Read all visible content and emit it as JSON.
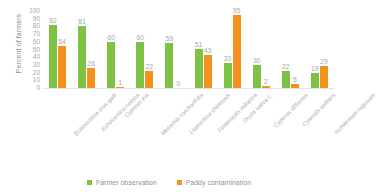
{
  "chart_data": {
    "type": "bar",
    "title": "",
    "subtitle": "",
    "xlabel": "",
    "ylabel": "Percent of farmers",
    "ylim": [
      0,
      100
    ],
    "ytick_step": 10,
    "yticks": [
      100,
      90,
      80,
      70,
      60,
      50,
      40,
      30,
      20,
      10,
      0
    ],
    "grid": false,
    "legend_position": "bottom-center",
    "categories": [
      "Echinochloa crus-galli",
      "Echinochloa colona",
      "Cyperus iria",
      "Melochia corchorifolia",
      "Leptochloa chinensis",
      "Fimbristylis miliacea",
      "Oryza sativa L.",
      "Cyperus difformis",
      "Cyanotis axillaris",
      "Ischaemum rugosum"
    ],
    "series": [
      {
        "name": "Farmer observation",
        "color": "#7DC242",
        "values": [
          82,
          81,
          60,
          60,
          59,
          51,
          33,
          30,
          22,
          19
        ]
      },
      {
        "name": "Paddy contamination",
        "color": "#F5911E",
        "values": [
          54,
          26,
          1,
          22,
          0,
          43,
          95,
          2,
          5,
          29
        ]
      }
    ]
  },
  "legend": {
    "items": [
      {
        "label": "Farmer observation"
      },
      {
        "label": "Paddy contamination"
      }
    ]
  }
}
